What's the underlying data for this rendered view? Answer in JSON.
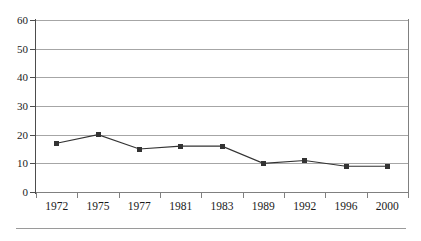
{
  "chart_data": {
    "type": "line",
    "title": "",
    "subtitle": "",
    "xlabel": "",
    "ylabel": "",
    "categories": [
      "1972",
      "1975",
      "1977",
      "1981",
      "1983",
      "1989",
      "1992",
      "1996",
      "2000"
    ],
    "values": [
      17,
      20,
      15,
      16,
      16,
      10,
      11,
      9,
      9
    ],
    "series": [
      {
        "name": "",
        "values": [
          17,
          20,
          15,
          16,
          16,
          10,
          11,
          9,
          9
        ]
      }
    ],
    "ylim": [
      0,
      60
    ],
    "yticks": [
      0,
      10,
      20,
      30,
      40,
      50,
      60
    ],
    "ytick_labels": [
      "0",
      "10",
      "20",
      "30",
      "40",
      "50",
      "60"
    ],
    "grid": "horizontal",
    "legend": "none",
    "marker": "square",
    "line_color": "#333333",
    "marker_color": "#333333",
    "grid_color": "#a6a6a6",
    "axis_color": "#4d4d4d",
    "background": "#ffffff"
  },
  "axes": {
    "y": {
      "ticks": [
        {
          "label": "60",
          "value": 60
        },
        {
          "label": "50",
          "value": 50
        },
        {
          "label": "40",
          "value": 40
        },
        {
          "label": "30",
          "value": 30
        },
        {
          "label": "20",
          "value": 20
        },
        {
          "label": "10",
          "value": 10
        },
        {
          "label": "0",
          "value": 0
        }
      ]
    },
    "x": {
      "ticks": [
        {
          "label": "1972"
        },
        {
          "label": "1975"
        },
        {
          "label": "1977"
        },
        {
          "label": "1981"
        },
        {
          "label": "1983"
        },
        {
          "label": "1989"
        },
        {
          "label": "1992"
        },
        {
          "label": "1996"
        },
        {
          "label": "2000"
        }
      ]
    }
  }
}
